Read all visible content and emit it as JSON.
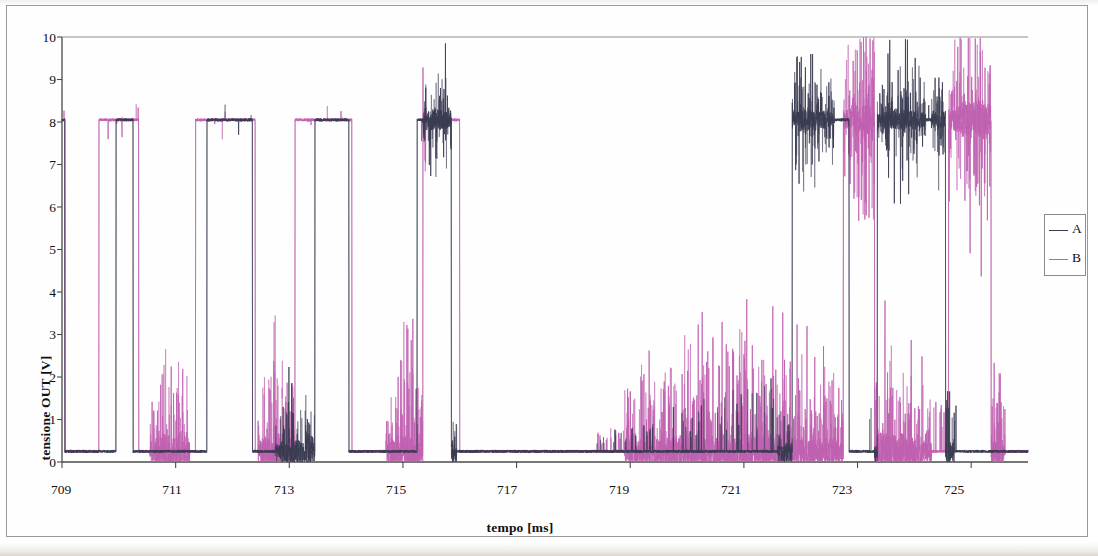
{
  "chart_data": {
    "type": "line",
    "title": "",
    "xlabel": "tempo [ms]",
    "ylabel": "tensione OUT [V]",
    "xlim": [
      709,
      726
    ],
    "ylim": [
      0,
      10
    ],
    "xticks": [
      709,
      711,
      713,
      715,
      717,
      719,
      721,
      723,
      725
    ],
    "yticks": [
      0,
      1,
      2,
      3,
      4,
      5,
      6,
      7,
      8,
      9,
      10
    ],
    "xtick_labels": [
      "709",
      "711",
      "713",
      "715",
      "717",
      "719",
      "721",
      "723",
      "725"
    ],
    "ytick_labels": [
      "0",
      "1",
      "2",
      "3",
      "4",
      "5",
      "6",
      "7",
      "8",
      "9",
      "10"
    ],
    "grid": false,
    "legend_position": "right",
    "high_level_v": 8.05,
    "low_level_v": 0.25,
    "series": [
      {
        "name": "A",
        "color": "#3a3c52",
        "description": "digital output A, square wave between 0.25 V and 8.05 V with transient noise bursts",
        "transitions_ms": [
          709.05,
          709.95,
          710.25,
          711.55,
          712.35,
          713.45,
          714.05,
          715.25,
          715.85,
          721.85,
          722.85,
          723.35,
          724.55
        ],
        "noise_bursts_ms": [
          [
            712.75,
            713.45
          ],
          [
            715.35,
            715.95
          ],
          [
            721.6,
            722.6
          ],
          [
            723.3,
            724.2
          ],
          [
            724.3,
            724.7
          ]
        ]
      },
      {
        "name": "B",
        "color": "#bf60b0",
        "description": "digital output B, square wave between 0.25 V and 8.05 V with large overshoot/ringing bursts",
        "transitions_ms": [
          709.05,
          709.65,
          710.35,
          711.35,
          712.4,
          713.1,
          714.1,
          715.35,
          716.0,
          722.75,
          723.3,
          724.6,
          725.35
        ],
        "noise_bursts_ms": [
          [
            710.55,
            711.25
          ],
          [
            712.45,
            713.1
          ],
          [
            714.7,
            715.4
          ],
          [
            718.9,
            722.8
          ],
          [
            722.8,
            724.3
          ],
          [
            724.6,
            725.6
          ]
        ]
      }
    ]
  },
  "legend": {
    "entries": [
      {
        "label": "A",
        "color": "#3a3c52"
      },
      {
        "label": "B",
        "color": "#bf60b0"
      }
    ]
  },
  "axes": {
    "y_title": "tensione OUT [V]",
    "x_title": "tempo [ms]"
  }
}
